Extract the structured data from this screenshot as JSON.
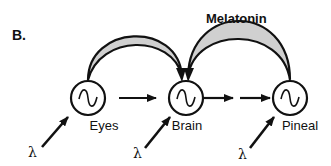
{
  "panel_label": "B.",
  "nodes": [
    {
      "id": "eyes",
      "label": "Eyes",
      "symbol": "sine-wave-oscillator"
    },
    {
      "id": "brain",
      "label": "Brain",
      "symbol": "sine-wave-oscillator"
    },
    {
      "id": "pineal",
      "label": "Pineal",
      "symbol": "sine-wave-oscillator"
    }
  ],
  "inputs": [
    {
      "target": "eyes",
      "label": "λ"
    },
    {
      "target": "brain",
      "label": "λ"
    },
    {
      "target": "pineal",
      "label": "λ"
    }
  ],
  "edges": [
    {
      "from": "eyes",
      "to": "brain",
      "style": "arrow"
    },
    {
      "from": "brain",
      "to": "pineal",
      "style": "double-arrow"
    },
    {
      "from": "eyes",
      "to": "brain",
      "style": "feedback-arc"
    },
    {
      "from": "pineal",
      "to": "brain",
      "style": "feedback-arc",
      "label": "Melatonin"
    }
  ],
  "colors": {
    "stroke": "#111111",
    "arc_fill": "#d0d0d0",
    "background": "#ffffff"
  }
}
